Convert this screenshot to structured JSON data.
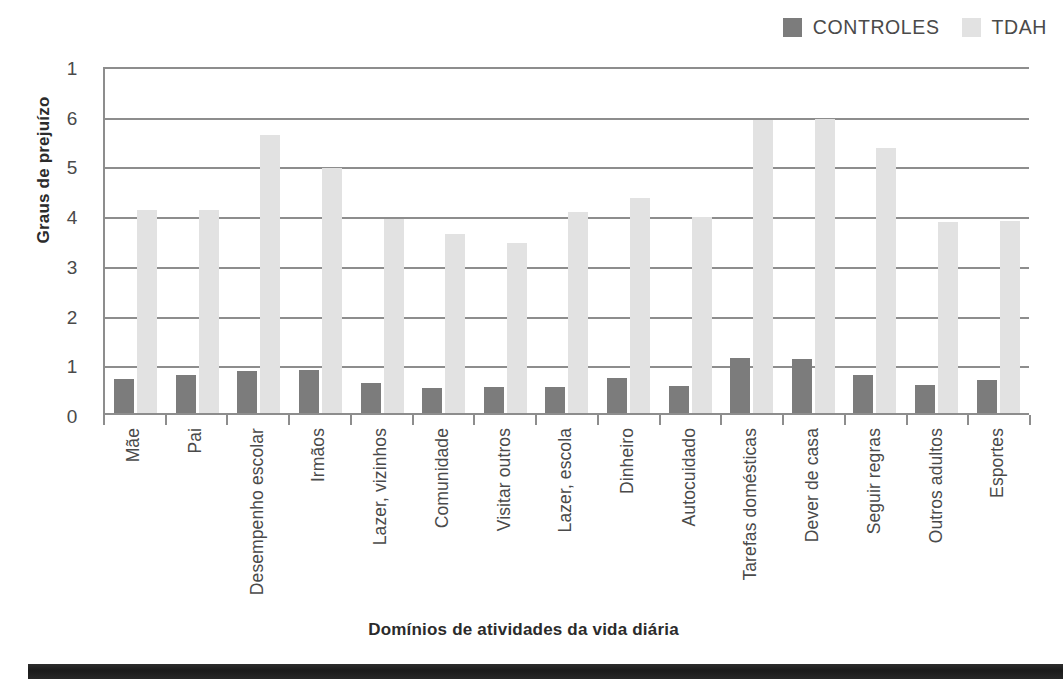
{
  "legend": {
    "items": [
      {
        "label": "CONTROLES",
        "color": "#7c7c7c",
        "icon": "square-swatch-icon"
      },
      {
        "label": "TDAH",
        "color": "#e2e2e2",
        "icon": "square-swatch-icon"
      }
    ]
  },
  "axes": {
    "ylabel": "Graus de prejuízo",
    "xlabel": "Domínios de atividades da vida diária",
    "yticks": [
      "1",
      "6",
      "5",
      "4",
      "3",
      "2",
      "1",
      "0"
    ]
  },
  "chart_data": {
    "type": "bar",
    "title": "",
    "xlabel": "Domínios de atividades da vida diária",
    "ylabel": "Graus de prejuízo",
    "ylim": [
      0,
      7
    ],
    "ytick_values": [
      0,
      1,
      2,
      3,
      4,
      5,
      6,
      7
    ],
    "ytick_labels": [
      "0",
      "1",
      "2",
      "3",
      "4",
      "5",
      "6",
      "1"
    ],
    "grid": true,
    "legend_position": "top-right",
    "categories": [
      "Mãe",
      "Pai",
      "Desempenho escolar",
      "Irmãos",
      "Lazer, vizinhos",
      "Comunidade",
      "Visitar outros",
      "Lazer, escola",
      "Dinheiro",
      "Autocuidado",
      "Tarefas domésticas",
      "Dever de casa",
      "Seguir regras",
      "Outros adultos",
      "Esportes"
    ],
    "series": [
      {
        "name": "CONTROLES",
        "color": "#7c7c7c",
        "values": [
          0.68,
          0.76,
          0.85,
          0.87,
          0.6,
          0.51,
          0.52,
          0.53,
          0.7,
          0.55,
          1.1,
          1.09,
          0.76,
          0.56,
          0.66
        ]
      },
      {
        "name": "TDAH",
        "color": "#e2e2e2",
        "values": [
          4.08,
          4.08,
          5.6,
          4.92,
          3.9,
          3.6,
          3.41,
          4.05,
          4.33,
          3.94,
          5.9,
          5.92,
          5.33,
          3.84,
          3.86
        ]
      }
    ]
  }
}
